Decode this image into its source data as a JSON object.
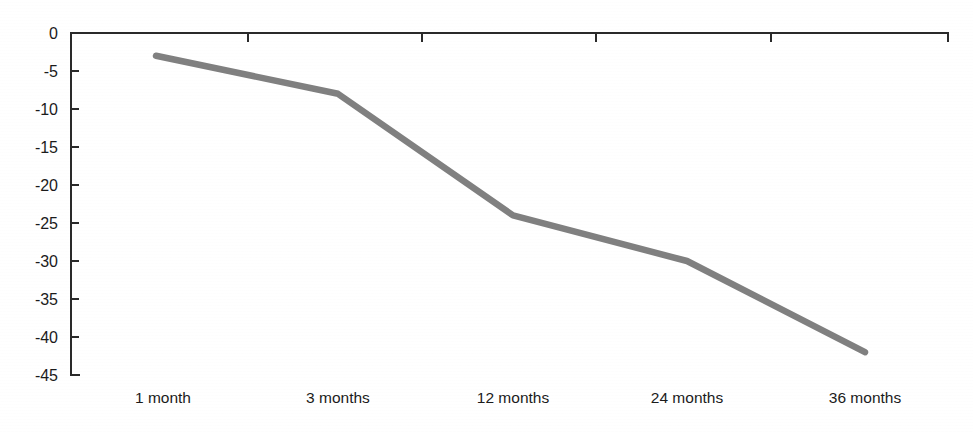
{
  "chart_data": {
    "type": "line",
    "title": "",
    "subtitle": "",
    "xlabel": "",
    "ylabel": "",
    "categories": [
      "1 month",
      "3 months",
      "12 months",
      "24 months",
      "36 months"
    ],
    "series": [
      {
        "name": "",
        "values": [
          -3,
          -8,
          -24,
          -30,
          -42
        ],
        "color": "#808080"
      }
    ],
    "ylim": [
      -45,
      0
    ],
    "yticks": [
      0,
      -5,
      -10,
      -15,
      -20,
      -25,
      -30,
      -35,
      -40,
      -45
    ],
    "ytick_labels": [
      "0",
      "-5",
      "-10",
      "-15",
      "-20",
      "-25",
      "-30",
      "-35",
      "-40",
      "-45"
    ],
    "xtick_labels": [
      "1 month",
      "3 months",
      "12 months",
      "24 months",
      "36 months"
    ],
    "grid": false,
    "legend": false,
    "legend_position": "none",
    "axis_color": "#2a2a2a",
    "background_color": "#ffffff",
    "annotations": []
  },
  "geometry": {
    "plot_left": 71,
    "plot_right": 948,
    "plot_top": 33,
    "plot_bottom": 375,
    "point_x": [
      156,
      338,
      513,
      687,
      865
    ],
    "xtick_x": [
      248,
      422,
      596,
      771
    ],
    "xlabel_x": [
      163,
      338,
      513,
      687,
      865
    ],
    "xlabel_y": 403,
    "line_width": 6.5
  }
}
